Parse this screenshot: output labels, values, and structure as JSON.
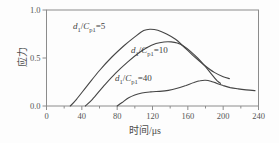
{
  "colors": {
    "background": "#fdfdfd",
    "frame": "#8c8c8c",
    "curve": "#454545",
    "tick_text": "#555555",
    "label_text": "#3f3f3f"
  },
  "chart_data": {
    "type": "line",
    "title": "",
    "xlabel": "时间/μs",
    "ylabel": "应力",
    "xlim": [
      0,
      240
    ],
    "ylim": [
      0,
      1.0
    ],
    "grid": false,
    "legend_position": "none (inline curve annotations)",
    "x_ticks": [
      0,
      40,
      80,
      120,
      160,
      200,
      240
    ],
    "x_tick_labels": [
      "0",
      "40",
      "80",
      "120",
      "160",
      "200",
      "240"
    ],
    "x_minor_ticks": [
      20,
      60,
      100,
      140,
      180,
      220
    ],
    "y_ticks": [
      0,
      0.5,
      1.0
    ],
    "y_tick_labels": [
      "0.0",
      "0.5",
      "1.0"
    ],
    "series": [
      {
        "name": "d1/Cp1=5",
        "label_parts": {
          "v1": "d",
          "s1": "1",
          "slash": "/",
          "v2": "C",
          "s2": "p1",
          "eq": "=5"
        },
        "points": [
          [
            27,
            0
          ],
          [
            34,
            0.07
          ],
          [
            46,
            0.21
          ],
          [
            60,
            0.37
          ],
          [
            74,
            0.51
          ],
          [
            88,
            0.63
          ],
          [
            100,
            0.72
          ],
          [
            110,
            0.785
          ],
          [
            117,
            0.8
          ],
          [
            126,
            0.79
          ],
          [
            136,
            0.75
          ],
          [
            146,
            0.695
          ],
          [
            154,
            0.63
          ],
          [
            166,
            0.525
          ],
          [
            178,
            0.43
          ],
          [
            190,
            0.35
          ],
          [
            200,
            0.305
          ],
          [
            207,
            0.285
          ]
        ]
      },
      {
        "name": "d1/Cp1=10",
        "label_parts": {
          "v1": "d",
          "s1": "1",
          "slash": "/",
          "v2": "C",
          "s2": "p1",
          "eq": "=10"
        },
        "points": [
          [
            44,
            0
          ],
          [
            52,
            0.07
          ],
          [
            64,
            0.2
          ],
          [
            78,
            0.34
          ],
          [
            92,
            0.46
          ],
          [
            104,
            0.55
          ],
          [
            114,
            0.61
          ],
          [
            124,
            0.65
          ],
          [
            133,
            0.667
          ],
          [
            141,
            0.668
          ],
          [
            148,
            0.655
          ],
          [
            155,
            0.625
          ],
          [
            163,
            0.57
          ],
          [
            171,
            0.5
          ],
          [
            179,
            0.42
          ],
          [
            187,
            0.33
          ],
          [
            193,
            0.265
          ],
          [
            197,
            0.235
          ]
        ]
      },
      {
        "name": "d1/Cp1=40",
        "label_parts": {
          "v1": "d",
          "s1": "1",
          "slash": "/",
          "v2": "C",
          "s2": "p1",
          "eq": "=40"
        },
        "points": [
          [
            80,
            0
          ],
          [
            86,
            0.04
          ],
          [
            93,
            0.085
          ],
          [
            100,
            0.115
          ],
          [
            108,
            0.135
          ],
          [
            118,
            0.147
          ],
          [
            128,
            0.152
          ],
          [
            138,
            0.162
          ],
          [
            148,
            0.185
          ],
          [
            158,
            0.215
          ],
          [
            167,
            0.245
          ],
          [
            174,
            0.263
          ],
          [
            180,
            0.268
          ],
          [
            186,
            0.258
          ],
          [
            193,
            0.235
          ],
          [
            200,
            0.213
          ],
          [
            208,
            0.192
          ],
          [
            217,
            0.178
          ],
          [
            226,
            0.168
          ],
          [
            236,
            0.16
          ]
        ]
      }
    ]
  }
}
